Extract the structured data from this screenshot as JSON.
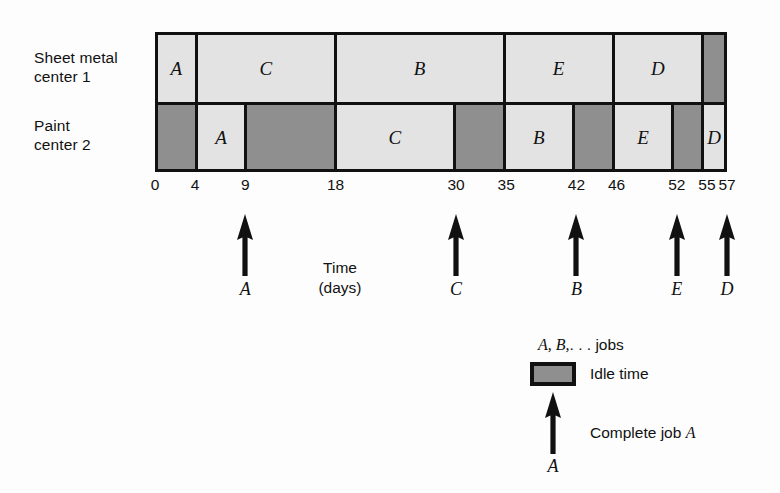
{
  "chart_data": {
    "type": "bar",
    "subtype": "gantt",
    "title": "",
    "xlabel": "Time\n(days)",
    "ylabel": "",
    "xlim": [
      0,
      57
    ],
    "grid": false,
    "legend_position": "bottom-right",
    "tick_values": [
      0,
      4,
      9,
      18,
      30,
      35,
      42,
      46,
      52,
      55,
      57
    ],
    "tick_labels": [
      "0",
      "4",
      "9",
      "18",
      "30",
      "35",
      "42",
      "46",
      "52",
      "55",
      "57"
    ],
    "rows": [
      {
        "name": "Sheet metal\ncenter 1",
        "segments": [
          {
            "label": "A",
            "start": 0,
            "end": 4,
            "kind": "job"
          },
          {
            "label": "C",
            "start": 4,
            "end": 18,
            "kind": "job"
          },
          {
            "label": "B",
            "start": 18,
            "end": 35,
            "kind": "job"
          },
          {
            "label": "E",
            "start": 35,
            "end": 46,
            "kind": "job"
          },
          {
            "label": "D",
            "start": 46,
            "end": 55,
            "kind": "job"
          },
          {
            "label": "",
            "start": 55,
            "end": 57,
            "kind": "idle"
          }
        ]
      },
      {
        "name": "Paint\ncenter 2",
        "segments": [
          {
            "label": "",
            "start": 0,
            "end": 4,
            "kind": "idle"
          },
          {
            "label": "A",
            "start": 4,
            "end": 9,
            "kind": "job"
          },
          {
            "label": "",
            "start": 9,
            "end": 18,
            "kind": "idle"
          },
          {
            "label": "C",
            "start": 18,
            "end": 30,
            "kind": "job"
          },
          {
            "label": "",
            "start": 30,
            "end": 35,
            "kind": "idle"
          },
          {
            "label": "B",
            "start": 35,
            "end": 42,
            "kind": "job"
          },
          {
            "label": "",
            "start": 42,
            "end": 46,
            "kind": "idle"
          },
          {
            "label": "E",
            "start": 46,
            "end": 52,
            "kind": "job"
          },
          {
            "label": "",
            "start": 52,
            "end": 55,
            "kind": "idle"
          },
          {
            "label": "D",
            "start": 55,
            "end": 57,
            "kind": "job"
          }
        ]
      }
    ],
    "completion_markers": [
      {
        "job": "A",
        "time": 9
      },
      {
        "job": "C",
        "time": 30
      },
      {
        "job": "B",
        "time": 42
      },
      {
        "job": "E",
        "time": 52
      },
      {
        "job": "D",
        "time": 57
      }
    ],
    "colors": {
      "job_fill": "#e3e3e3",
      "idle_fill": "#8f8f8f",
      "outline": "#111111",
      "background": "#fdfdfd"
    }
  },
  "rows_axis": {
    "machine_1_label": "Sheet metal\ncenter 1",
    "machine_2_label": "Paint\ncenter 2"
  },
  "axis": {
    "title": "Time\n(days)"
  },
  "legend": {
    "jobs_note_prefix": "A, B,",
    "jobs_note_ellipsis": ". . .",
    "jobs_note_suffix": "jobs",
    "idle_label": "Idle time",
    "complete_prefix": "Complete job",
    "complete_job": "A",
    "arrow_job_label": "A"
  }
}
